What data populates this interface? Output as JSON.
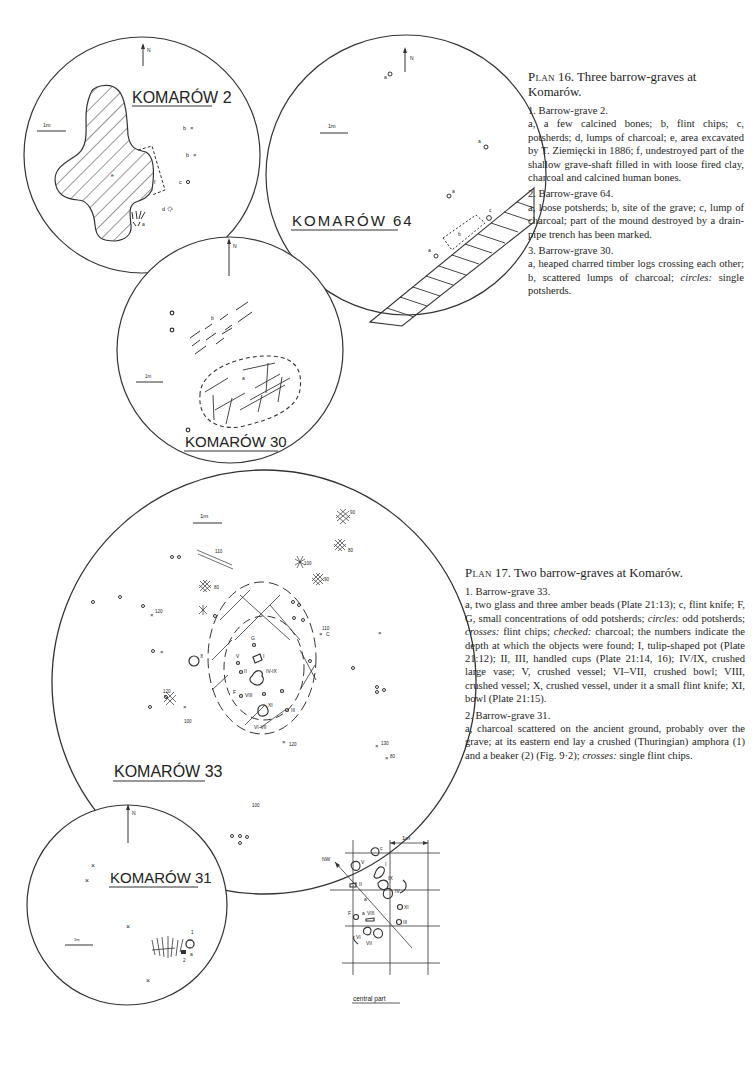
{
  "plan16": {
    "title_prefix": "Plan",
    "title_number": "16.",
    "title_text": "Three barrow-graves at Komarów.",
    "items": [
      {
        "heading": "1. Barrow-grave 2.",
        "text": "a, a few calcined bones; b, flint chips; c, potsherds; d, lumps of charcoal; e, area excavated by T. Ziemięcki in 1886; f, undestroyed part of the shallow grave-shaft filled in with loose fired clay, charcoal and calcined human bones."
      },
      {
        "heading": "2. Barrow-grave 64.",
        "text": "a, loose potsherds; b, site of the grave; c, lump of charcoal; part of the mound destroyed by a drain-pipe trench has been marked."
      },
      {
        "heading": "3. Barrow-grave 30.",
        "text_before": "a, heaped charred timber logs crossing each other; b, scattered lumps of charcoal;",
        "italic": "circles:",
        "text_after": "single potsherds."
      }
    ]
  },
  "plan17": {
    "title_prefix": "Plan",
    "title_number": "17.",
    "title_text": "Two barrow-graves at Komarów.",
    "items": [
      {
        "heading": "1. Barrow-grave 33.",
        "seg1": "a, two glass and three amber beads (Plate 21:13); c, flint knife; F, G, small concentrations of odd potsherds;",
        "it1": "circles:",
        "seg2": "odd potsherds;",
        "it2": "crosses:",
        "seg3": "flint chips;",
        "it3": "checked:",
        "seg4": "charcoal; the numbers indicate the depth at which the objects were found; I, tulip-shaped pot (Plate 21:12); II, III, handled cups (Plate 21:14, 16); IV/IX, crushed large vase; V, crushed vessel; VI–VII, crushed bowl; VIII, crushed vessel; X, crushed vessel, under it a small flint knife; XI, bowl (Plate 21:15)."
      },
      {
        "heading": "2. Barrow-grave 31.",
        "seg1": "a, charcoal scattered on the ancient ground, probably over the grave; at its eastern end lay a crushed (Thuringian) amphora (1) and a beaker (2) (Fig. 9·2);",
        "it1": "crosses:",
        "seg2": "single flint chips."
      }
    ]
  },
  "plans": {
    "k2": {
      "label": "KOMARÓW 2",
      "north": "N",
      "scale": "1m",
      "marks": [
        "a",
        "b",
        "b",
        "c",
        "d",
        "e",
        "f"
      ]
    },
    "k64": {
      "label": "KOMARÓW 64",
      "north": "N",
      "scale": "1m",
      "marks": [
        "a",
        "a",
        "a",
        "a",
        "b",
        "c"
      ]
    },
    "k30": {
      "label": "KOMARÓW 30",
      "north": "N",
      "scale": "1m",
      "marks": [
        "a",
        "b"
      ]
    },
    "k33": {
      "label": "KOMARÓW 33",
      "scale": "1m",
      "depths": [
        "110",
        "80",
        "120",
        "120",
        "100",
        "90",
        "80",
        "100",
        "90",
        "110",
        "130",
        "80",
        "120",
        "100"
      ],
      "roman": [
        "I",
        "II",
        "III",
        "IV-IX",
        "V",
        "VI-VII",
        "VIII",
        "X",
        "XI"
      ],
      "letters": [
        "C",
        "F",
        "G"
      ]
    },
    "k31": {
      "label": "KOMARÓW 31",
      "north": "N",
      "scale": "1m",
      "marks": [
        "a",
        "1",
        "2"
      ]
    },
    "central": {
      "label": "central part",
      "scale": "1m",
      "direction": "NW",
      "roman": [
        "I",
        "II",
        "III",
        "IV",
        "V",
        "VI",
        "VII",
        "VIII",
        "IX",
        "X",
        "XI"
      ],
      "letters": [
        "a",
        "a",
        "c",
        "F"
      ]
    }
  }
}
